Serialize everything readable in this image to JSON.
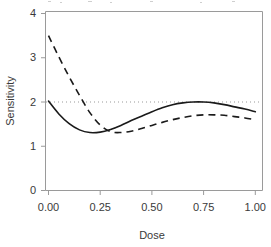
{
  "chart_data": {
    "type": "line",
    "title": "",
    "xlabel": "Dose",
    "ylabel": "Sensitivity",
    "xlim": [
      0.0,
      1.0
    ],
    "ylim": [
      0.0,
      4.0
    ],
    "grid": false,
    "legend": "none",
    "xticks": [
      0.0,
      0.25,
      0.5,
      0.75,
      1.0
    ],
    "xtick_labels": [
      "0.00",
      "0.25",
      "0.50",
      "0.75",
      "1.00"
    ],
    "yticks": [
      0,
      1,
      2,
      3,
      4
    ],
    "ytick_labels": [
      "0",
      "1",
      "2",
      "3",
      "4"
    ],
    "annotations": [
      {
        "name": "reference-line",
        "kind": "horizontal-dotted-line",
        "y": 2.0,
        "label": ""
      }
    ],
    "series": [
      {
        "name": "solid-curve",
        "style": "solid",
        "color": "#1a1a1a",
        "x": [
          0.0,
          0.05,
          0.1,
          0.15,
          0.2,
          0.25,
          0.3,
          0.35,
          0.4,
          0.45,
          0.5,
          0.55,
          0.6,
          0.65,
          0.7,
          0.75,
          0.8,
          0.85,
          0.9,
          0.95,
          1.0
        ],
        "values": [
          2.02,
          1.73,
          1.51,
          1.37,
          1.31,
          1.32,
          1.38,
          1.47,
          1.58,
          1.68,
          1.78,
          1.87,
          1.94,
          1.98,
          2.0,
          2.0,
          1.98,
          1.94,
          1.89,
          1.84,
          1.78
        ]
      },
      {
        "name": "dashed-curve",
        "style": "dashed",
        "color": "#1a1a1a",
        "x": [
          0.0,
          0.05,
          0.1,
          0.15,
          0.2,
          0.25,
          0.3,
          0.35,
          0.4,
          0.45,
          0.5,
          0.55,
          0.6,
          0.65,
          0.7,
          0.75,
          0.8,
          0.85,
          0.9,
          0.95,
          1.0
        ],
        "values": [
          3.5,
          3.02,
          2.57,
          2.15,
          1.76,
          1.48,
          1.33,
          1.31,
          1.34,
          1.4,
          1.47,
          1.54,
          1.6,
          1.65,
          1.69,
          1.71,
          1.71,
          1.7,
          1.67,
          1.64,
          1.6
        ]
      }
    ]
  },
  "axes": {
    "x_title": "Dose",
    "y_title": "Sensitivity"
  }
}
